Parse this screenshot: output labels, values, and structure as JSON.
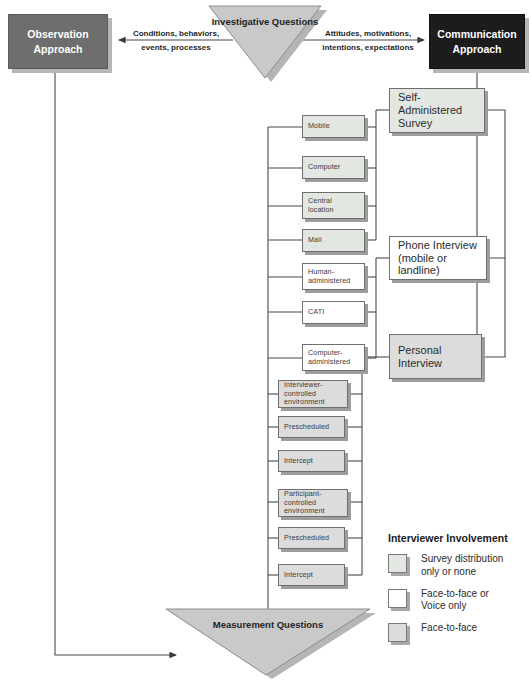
{
  "diagram": {
    "top": {
      "observation_approach": "Observation\nApproach",
      "communication_approach": "Communication\nApproach",
      "investigative_questions": "Investigative\nQuestions",
      "left_edge_label": "Conditions, behaviors,\nevents, processes",
      "right_edge_label": "Attitudes, motivations,\nintentions, expectations"
    },
    "bottom": {
      "measurement_questions": "Measurement Questions"
    },
    "modes": [
      {
        "id": "mobile",
        "label": "Mobile",
        "fill": "green"
      },
      {
        "id": "computer",
        "label": "Computer",
        "fill": "green"
      },
      {
        "id": "central-location",
        "label": "Central\nlocation",
        "fill": "green"
      },
      {
        "id": "mail",
        "label": "Mail",
        "fill": "green"
      },
      {
        "id": "human-administered",
        "label": "Human-\nadministered",
        "fill": "white"
      },
      {
        "id": "cati",
        "label": "CATI",
        "fill": "white"
      },
      {
        "id": "computer-administered",
        "label": "Computer-\nadministered",
        "fill": "white"
      },
      {
        "id": "interviewer-controlled",
        "label": "Interviewer-controlled\nenvironment",
        "fill": "gray"
      },
      {
        "id": "prescheduled-1",
        "label": "Prescheduled",
        "fill": "gray"
      },
      {
        "id": "intercept-1",
        "label": "Intercept",
        "fill": "gray"
      },
      {
        "id": "participant-controlled",
        "label": "Participant-controlled\nenvironment",
        "fill": "gray"
      },
      {
        "id": "prescheduled-2",
        "label": "Prescheduled",
        "fill": "gray"
      },
      {
        "id": "intercept-2",
        "label": "Intercept",
        "fill": "gray"
      }
    ],
    "methods": [
      {
        "id": "self-administered-survey",
        "label": "Self-Administered\nSurvey",
        "fill": "green"
      },
      {
        "id": "phone-interview",
        "label": "Phone Interview\n(mobile or landline)",
        "fill": "white"
      },
      {
        "id": "personal-interview",
        "label": "Personal\nInterview",
        "fill": "gray"
      }
    ],
    "legend": {
      "title": "Interviewer Involvement",
      "items": [
        {
          "swatch": "green",
          "label": "Survey distribution\nonly or none"
        },
        {
          "swatch": "white",
          "label": "Face-to-face or\nVoice only"
        },
        {
          "swatch": "gray",
          "label": "Face-to-face"
        }
      ]
    },
    "colors": {
      "observation_box": "#6e6e6e",
      "communication_box": "#1c1c1c",
      "triangle_fill": "#c9c9c9",
      "swatch_green": "#e2e7e2",
      "swatch_white": "#ffffff",
      "swatch_gray": "#dcdcdc",
      "line": "#4a4a4a"
    }
  }
}
